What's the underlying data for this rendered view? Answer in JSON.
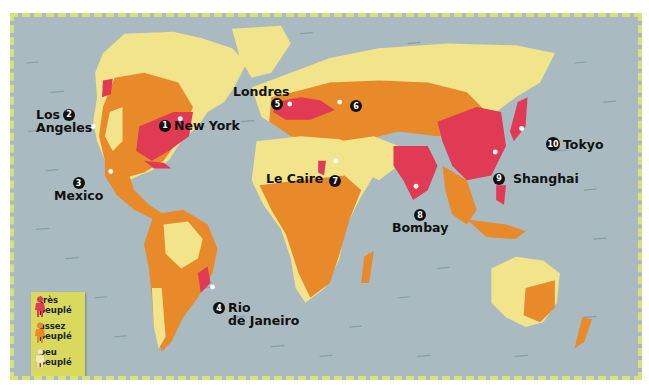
{
  "map": {
    "title": "Densité de population mondiale",
    "colors": {
      "ocean": "#a9bbc0",
      "peu_peuple": "#f2e48a",
      "assez_peuple": "#e8892a",
      "tres_peuple": "#e03a55",
      "frame_border": "#d9e27a",
      "legend_bg": "#d9d95e"
    },
    "cities": [
      {
        "num": "1",
        "name": "New York"
      },
      {
        "num": "2",
        "name": "Los Angeles",
        "line1": "Los",
        "line2": "Angeles"
      },
      {
        "num": "3",
        "name": "Mexico"
      },
      {
        "num": "4",
        "name": "Rio de Janeiro",
        "line1": "Rio",
        "line2": "de Janeiro"
      },
      {
        "num": "5",
        "name": "Londres"
      },
      {
        "num": "6",
        "name": ""
      },
      {
        "num": "7",
        "name": "Le Caire"
      },
      {
        "num": "8",
        "name": "Bombay"
      },
      {
        "num": "9",
        "name": "Shanghai"
      },
      {
        "num": "10",
        "name": "Tokyo"
      }
    ],
    "legend": [
      {
        "label_line1": "très",
        "label_line2": "peuplé",
        "color": "#e03a55",
        "icon": "person-icon"
      },
      {
        "label_line1": "assez",
        "label_line2": "peuplé",
        "color": "#e8892a",
        "icon": "person-icon"
      },
      {
        "label_line1": "peu",
        "label_line2": "peuplé",
        "color": "#f4ecb8",
        "icon": "person-icon"
      }
    ]
  }
}
